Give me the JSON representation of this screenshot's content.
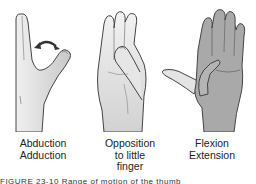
{
  "figures": [
    {
      "id": "abduction-adduction",
      "labels": [
        "Abduction",
        "Adduction"
      ],
      "shade": "#e2e2e2",
      "has_arrow": true
    },
    {
      "id": "opposition",
      "labels": [
        "Opposition",
        "to little",
        "finger"
      ],
      "shade": "#e4e4e4",
      "has_arrow": false
    },
    {
      "id": "flexion-extension",
      "labels": [
        "Flexion",
        "Extension"
      ],
      "shade": "#a9a9a9",
      "has_arrow": false
    }
  ],
  "caption": "FIGURE 23-10  Range of motion of the thumb",
  "colors": {
    "outline": "#444444",
    "light_hand": "#e3e3e3",
    "dark_hand": "#a8a8a8",
    "thumb_light": "#e8e8e8",
    "arrow": "#333333"
  }
}
